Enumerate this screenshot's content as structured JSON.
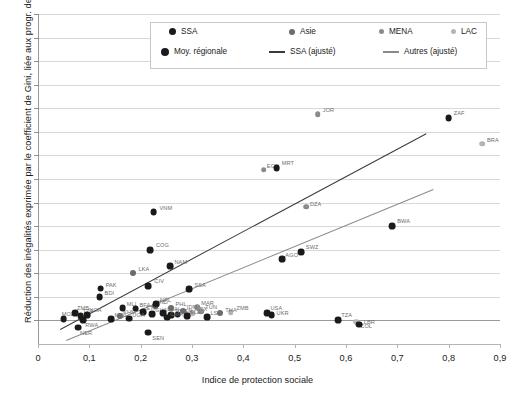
{
  "chart_data": {
    "type": "scatter",
    "title": "",
    "xlabel": "Indice de protection sociale",
    "ylabel": "Réduction des inégalités exprimée par le coefficient de Gini, liée aux progr. de PST (%)",
    "xlim": [
      0,
      0.9
    ],
    "ylim": [
      -1,
      13
    ],
    "xticks": [
      "0",
      "0,1",
      "0,2",
      "0,3",
      "0,4",
      "0,5",
      "0,6",
      "0,7",
      "0,8",
      "0,9"
    ],
    "xtick_values": [
      0,
      0.1,
      0.2,
      0.3,
      0.4,
      0.5,
      0.6,
      0.7,
      0.8,
      0.9
    ],
    "yticks": [
      "0",
      "1",
      "2",
      "3",
      "4",
      "5",
      "6",
      "7",
      "8",
      "9",
      "10",
      "11",
      "12",
      "13"
    ],
    "ytick_values": [
      0,
      1,
      2,
      3,
      4,
      5,
      6,
      7,
      8,
      9,
      10,
      11,
      12,
      13
    ],
    "grid": "horizontal",
    "legend_position": "top-center",
    "legend": [
      {
        "label": "SSA",
        "marker": "circle",
        "color": "#1a1a1a",
        "size": 7
      },
      {
        "label": "Asie",
        "marker": "circle",
        "color": "#6b6b6b",
        "size": 6
      },
      {
        "label": "MENA",
        "marker": "circle",
        "color": "#8a8a8a",
        "size": 5
      },
      {
        "label": "LAC",
        "marker": "circle",
        "color": "#b4b4b4",
        "size": 5
      },
      {
        "label": "Moy. régionale",
        "marker": "circle",
        "color": "#1a1a1a",
        "size": 8
      },
      {
        "label": "SSA (ajusté)",
        "marker": "line",
        "color": "#3a3a3a"
      },
      {
        "label": "Autres (ajusté)",
        "marker": "line",
        "color": "#8a8a8a"
      }
    ],
    "series": [
      {
        "name": "SSA",
        "color": "#1a1a1a",
        "radius": 3.4,
        "points": [
          {
            "code": "MUS",
            "x": 0.69,
            "y": 10.85,
            "lx": 5,
            "ly": -5
          },
          {
            "code": "ZAF",
            "x": 0.8,
            "y": 8.6,
            "lx": 5,
            "ly": -5
          },
          {
            "code": "MRT",
            "x": 0.465,
            "y": 6.45,
            "lx": 5,
            "ly": -5
          },
          {
            "code": "VNM",
            "x": 0.225,
            "y": 4.6,
            "lx": 6,
            "ly": 0
          },
          {
            "code": "BWA",
            "x": 0.69,
            "y": 4.0,
            "lx": 5,
            "ly": -5
          },
          {
            "code": "COG",
            "x": 0.218,
            "y": 3.0,
            "lx": 6,
            "ly": -5
          },
          {
            "code": "SWZ",
            "x": 0.512,
            "y": 2.9,
            "lx": 5,
            "ly": -5
          },
          {
            "code": "AGO",
            "x": 0.476,
            "y": 2.6,
            "lx": 3,
            "ly": 0
          },
          {
            "code": "NAM",
            "x": 0.258,
            "y": 2.3,
            "lx": 4,
            "ly": -4
          },
          {
            "code": "SSA",
            "x": 0.295,
            "y": 1.32,
            "lx": 5,
            "ly": -4
          },
          {
            "code": "CIV",
            "x": 0.215,
            "y": 1.45,
            "lx": 6,
            "ly": -5
          },
          {
            "code": "PAK",
            "x": 0.122,
            "y": 1.35,
            "lx": 5,
            "ly": -4
          },
          {
            "code": "BDI",
            "x": 0.12,
            "y": 1.0,
            "lx": 5,
            "ly": -4
          },
          {
            "code": "MLI",
            "x": 0.165,
            "y": 0.52,
            "lx": 4,
            "ly": -4
          },
          {
            "code": "BFA",
            "x": 0.19,
            "y": 0.5,
            "lx": 4,
            "ly": -4
          },
          {
            "code": "NPL",
            "x": 0.23,
            "y": 0.7,
            "lx": 4,
            "ly": -4
          },
          {
            "code": "ETH",
            "x": 0.205,
            "y": 0.35,
            "lx": 3,
            "ly": -4
          },
          {
            "code": "GHA",
            "x": 0.222,
            "y": 0.28,
            "lx": 3,
            "ly": -4
          },
          {
            "code": "BEN",
            "x": 0.244,
            "y": 0.3,
            "lx": 4,
            "ly": -4
          },
          {
            "code": "TGO",
            "x": 0.26,
            "y": 0.22,
            "lx": 3,
            "ly": -4
          },
          {
            "code": "KEN",
            "x": 0.272,
            "y": 0.25,
            "lx": 3,
            "ly": -4
          },
          {
            "code": "SLE",
            "x": 0.29,
            "y": 0.18,
            "lx": 3,
            "ly": -4
          },
          {
            "code": "MOZ",
            "x": 0.05,
            "y": 0.05,
            "lx": -2,
            "ly": -5
          },
          {
            "code": "ZMB",
            "x": 0.072,
            "y": 0.3,
            "lx": 2,
            "ly": -5
          },
          {
            "code": "TZA",
            "x": 0.083,
            "y": 0.18,
            "lx": 2,
            "ly": -5
          },
          {
            "code": "NGA",
            "x": 0.096,
            "y": 0.22,
            "lx": 2,
            "ly": -5
          },
          {
            "code": "RWA",
            "x": 0.088,
            "y": 0.02,
            "lx": 2,
            "ly": 5
          },
          {
            "code": "NER",
            "x": 0.078,
            "y": -0.3,
            "lx": 2,
            "ly": 5
          },
          {
            "code": "SEN",
            "x": 0.215,
            "y": -0.52,
            "lx": 4,
            "ly": 5
          },
          {
            "code": "MWI",
            "x": 0.143,
            "y": 0.06,
            "lx": 3,
            "ly": -4
          },
          {
            "code": "UGA",
            "x": 0.178,
            "y": 0.08,
            "lx": 3,
            "ly": -4
          },
          {
            "code": "CMR",
            "x": 0.252,
            "y": 0.12,
            "lx": 3,
            "ly": -4
          },
          {
            "code": "LSO",
            "x": 0.33,
            "y": 0.15,
            "lx": 3,
            "ly": -4
          },
          {
            "code": "USA",
            "x": 0.447,
            "y": 0.3,
            "lx": 3,
            "ly": -5
          },
          {
            "code": "UKR",
            "x": 0.455,
            "y": 0.22,
            "lx": 5,
            "ly": -2
          },
          {
            "code": "TZA2",
            "x": 0.585,
            "y": 0.0,
            "lx": 3,
            "ly": -5
          },
          {
            "code": "LBR",
            "x": 0.625,
            "y": -0.18,
            "lx": 5,
            "ly": -3
          }
        ]
      },
      {
        "name": "Asie",
        "color": "#6b6b6b",
        "radius": 3.0,
        "points": [
          {
            "code": "LKA",
            "x": 0.186,
            "y": 2.0,
            "lx": 5,
            "ly": -4
          },
          {
            "code": "PHL",
            "x": 0.26,
            "y": 0.52,
            "lx": 4,
            "ly": -4
          },
          {
            "code": "IDN",
            "x": 0.282,
            "y": 0.4,
            "lx": 4,
            "ly": -4
          },
          {
            "code": "THA",
            "x": 0.355,
            "y": 0.32,
            "lx": 5,
            "ly": -3
          },
          {
            "code": "IND",
            "x": 0.228,
            "y": 0.62,
            "lx": 3,
            "ly": -4
          },
          {
            "code": "KHM",
            "x": 0.16,
            "y": 0.18,
            "lx": 3,
            "ly": -4
          }
        ]
      },
      {
        "name": "MENA",
        "color": "#8a8a8a",
        "radius": 2.8,
        "points": [
          {
            "code": "JOR",
            "x": 0.545,
            "y": 8.75,
            "lx": 5,
            "ly": -4
          },
          {
            "code": "EGY",
            "x": 0.44,
            "y": 6.4,
            "lx": 3,
            "ly": -4
          },
          {
            "code": "DZA",
            "x": 0.522,
            "y": 4.82,
            "lx": 4,
            "ly": -3
          },
          {
            "code": "MAR",
            "x": 0.31,
            "y": 0.55,
            "lx": 4,
            "ly": -4
          },
          {
            "code": "TUN",
            "x": 0.318,
            "y": 0.4,
            "lx": 4,
            "ly": -4
          }
        ]
      },
      {
        "name": "LAC",
        "color": "#b4b4b4",
        "radius": 2.8,
        "points": [
          {
            "code": "BRA",
            "x": 0.865,
            "y": 7.5,
            "lx": 5,
            "ly": -4
          },
          {
            "code": "ZMB",
            "x": 0.375,
            "y": 0.35,
            "lx": 6,
            "ly": -4
          },
          {
            "code": "COL",
            "x": 0.62,
            "y": -0.05,
            "lx": 4,
            "ly": 4
          },
          {
            "code": "MEX",
            "x": 0.3,
            "y": 0.3,
            "lx": 3,
            "ly": -4
          }
        ]
      }
    ],
    "fit_lines": [
      {
        "name": "SSA (ajusté)",
        "color": "#3a3a3a",
        "width": 1.6,
        "x1": 0.042,
        "y1": -0.35,
        "x2": 0.755,
        "y2": 7.95
      },
      {
        "name": "Autres (ajusté)",
        "color": "#8a8a8a",
        "width": 1.6,
        "x1": 0.055,
        "y1": -0.85,
        "x2": 0.77,
        "y2": 5.55
      }
    ]
  }
}
